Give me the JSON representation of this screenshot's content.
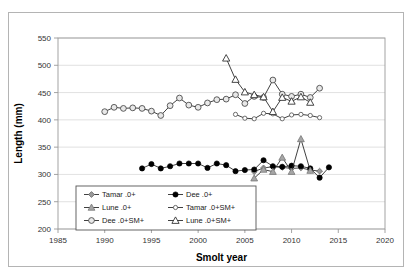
{
  "chart_data": {
    "type": "line",
    "title": "",
    "xlabel": "Smolt year",
    "ylabel": "Length (mm)",
    "xlim": [
      1985,
      2020
    ],
    "ylim": [
      200,
      550
    ],
    "xticks": [
      1985,
      1990,
      1995,
      2000,
      2005,
      2010,
      2015,
      2020
    ],
    "yticks": [
      200,
      250,
      300,
      350,
      400,
      450,
      500,
      550
    ],
    "grid": "horizontal",
    "legend_position": "inside-lower-left",
    "series": [
      {
        "name": "Tamar .0+",
        "marker": "diamond-grey",
        "color": "#808080",
        "x": [
          2006,
          2007,
          2008,
          2009,
          2010,
          2011,
          2012,
          2013
        ],
        "values": [
          305,
          312,
          314,
          313,
          311,
          312,
          308,
          306
        ]
      },
      {
        "name": "Dee .0+",
        "marker": "circle-filled",
        "color": "#000000",
        "x": [
          1994,
          1995,
          1996,
          1997,
          1998,
          1999,
          2000,
          2001,
          2002,
          2003,
          2004,
          2005,
          2006,
          2007,
          2008,
          2009,
          2010,
          2011,
          2012,
          2013,
          2014
        ],
        "values": [
          311,
          319,
          311,
          315,
          320,
          320,
          320,
          312,
          320,
          317,
          306,
          308,
          309,
          326,
          315,
          314,
          316,
          315,
          311,
          294,
          313
        ]
      },
      {
        "name": "Lune .0+",
        "marker": "triangle-grey",
        "color": "#999999",
        "x": [
          2006,
          2007,
          2008,
          2009,
          2010,
          2011,
          2012
        ],
        "values": [
          293,
          309,
          305,
          331,
          305,
          365,
          307
        ]
      },
      {
        "name": "Tamar .0+SM+",
        "marker": "circle-open-small",
        "color": "#666666",
        "x": [
          2004,
          2005,
          2006,
          2007,
          2008,
          2009,
          2010,
          2011,
          2012,
          2013
        ],
        "values": [
          410,
          403,
          402,
          412,
          411,
          402,
          409,
          410,
          408,
          404
        ]
      },
      {
        "name": "Dee .0+SM+",
        "marker": "circle-open-large",
        "color": "#555555",
        "x": [
          1990,
          1991,
          1992,
          1993,
          1994,
          1995,
          1996,
          1997,
          1998,
          1999,
          2000,
          2001,
          2002,
          2003,
          2004,
          2005,
          2006,
          2007,
          2008,
          2009,
          2010,
          2011,
          2012,
          2013
        ],
        "values": [
          415,
          423,
          421,
          422,
          421,
          416,
          408,
          426,
          440,
          427,
          423,
          431,
          437,
          438,
          446,
          430,
          443,
          441,
          473,
          447,
          443,
          447,
          441,
          458
        ]
      },
      {
        "name": "Lune .0+SM+",
        "marker": "triangle-open",
        "color": "#444444",
        "x": [
          2003,
          2004,
          2005,
          2006,
          2007,
          2008,
          2009,
          2010,
          2011,
          2012
        ],
        "values": [
          513,
          474,
          451,
          446,
          442,
          415,
          441,
          434,
          442,
          432
        ]
      }
    ]
  },
  "legend": {
    "entries": [
      {
        "label": "Tamar .0+",
        "marker": "diamond-grey"
      },
      {
        "label": "Dee .0+",
        "marker": "circle-filled"
      },
      {
        "label": "Lune .0+",
        "marker": "triangle-grey"
      },
      {
        "label": "Tamar .0+SM+",
        "marker": "circle-open-small"
      },
      {
        "label": "Dee .0+SM+",
        "marker": "circle-open-large"
      },
      {
        "label": "Lune .0+SM+",
        "marker": "triangle-open"
      }
    ]
  },
  "axes": {
    "y_title": "Length (mm)",
    "x_title": "Smolt year",
    "y_tick_labels": [
      "550",
      "500",
      "450",
      "400",
      "350",
      "300",
      "250",
      "200"
    ],
    "x_tick_labels": [
      "1985",
      "1990",
      "1995",
      "2000",
      "2005",
      "2010",
      "2015",
      "2020"
    ]
  },
  "colors": {
    "frame": "#b4b4b4",
    "gridline": "#d9d9d9",
    "axis": "#9a9a9a",
    "text": "#222222",
    "background": "#ffffff"
  }
}
